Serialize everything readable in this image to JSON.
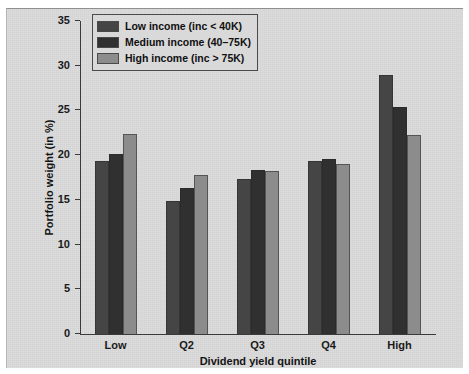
{
  "chart_data": {
    "type": "bar",
    "title": "",
    "xlabel": "Dividend yield quintile",
    "ylabel": "Portfolio weight (in %)",
    "categories": [
      "Low",
      "Q2",
      "Q3",
      "Q4",
      "High"
    ],
    "ylim": [
      0,
      35
    ],
    "yticks": [
      0,
      5,
      10,
      15,
      20,
      25,
      30,
      35
    ],
    "ytick_labels": [
      "0",
      "5",
      "10",
      "15",
      "20",
      "25",
      "30",
      "35"
    ],
    "grid": false,
    "legend_position": "top-left",
    "series": [
      {
        "name": "Low income (inc < 40K)",
        "color": "#454545",
        "values": [
          19.3,
          14.9,
          17.3,
          19.3,
          29.0
        ]
      },
      {
        "name": "Medium income (40–75K)",
        "color": "#303030",
        "values": [
          20.1,
          16.3,
          18.3,
          19.6,
          25.4
        ]
      },
      {
        "name": "High income (inc > 75K)",
        "color": "#8c8c8c",
        "values": [
          22.4,
          17.8,
          18.2,
          19.0,
          22.3
        ]
      }
    ]
  },
  "figure": {
    "panel_color": "#d9d9d9",
    "axis_color": "#3a3a3a",
    "text_color": "#141414"
  }
}
